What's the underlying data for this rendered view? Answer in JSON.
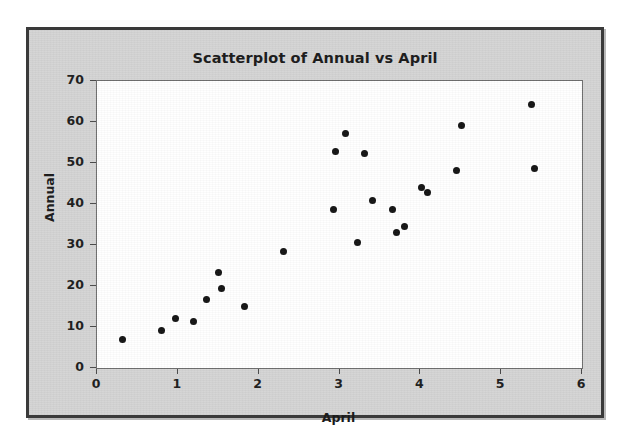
{
  "figure": {
    "title": "Scatterplot of Annual vs April",
    "background_color": "#d4d4d4",
    "plot_background_color": "#ffffff",
    "border_color": "#3a3a3a",
    "point_color": "#141414"
  },
  "axes": {
    "x_title": "April",
    "y_title": "Annual",
    "x_ticks": [
      "0",
      "1",
      "2",
      "3",
      "4",
      "5",
      "6"
    ],
    "y_ticks": [
      "0",
      "10",
      "20",
      "30",
      "40",
      "50",
      "60",
      "70"
    ]
  },
  "chart_data": {
    "type": "scatter",
    "title": "Scatterplot of Annual vs April",
    "xlabel": "April",
    "ylabel": "Annual",
    "xlim": [
      0,
      6
    ],
    "ylim": [
      0,
      70
    ],
    "xticks": [
      0,
      1,
      2,
      3,
      4,
      5,
      6
    ],
    "yticks": [
      0,
      10,
      20,
      30,
      40,
      50,
      60,
      70
    ],
    "grid": false,
    "legend": null,
    "marker": "filled-circle",
    "series": [
      {
        "name": "Annual vs April",
        "points": [
          {
            "x": 0.32,
            "y": 6.9
          },
          {
            "x": 0.8,
            "y": 9.2
          },
          {
            "x": 0.97,
            "y": 12.0
          },
          {
            "x": 1.19,
            "y": 11.4
          },
          {
            "x": 1.35,
            "y": 16.8
          },
          {
            "x": 1.5,
            "y": 23.3
          },
          {
            "x": 1.54,
            "y": 19.4
          },
          {
            "x": 1.82,
            "y": 15.0
          },
          {
            "x": 2.31,
            "y": 28.3
          },
          {
            "x": 2.92,
            "y": 38.6
          },
          {
            "x": 2.95,
            "y": 52.7
          },
          {
            "x": 3.07,
            "y": 57.2
          },
          {
            "x": 3.22,
            "y": 30.6
          },
          {
            "x": 3.31,
            "y": 52.3
          },
          {
            "x": 3.41,
            "y": 40.8
          },
          {
            "x": 3.66,
            "y": 38.6
          },
          {
            "x": 3.7,
            "y": 33.1
          },
          {
            "x": 3.81,
            "y": 34.6
          },
          {
            "x": 4.02,
            "y": 44.0
          },
          {
            "x": 4.09,
            "y": 42.9
          },
          {
            "x": 4.45,
            "y": 48.1
          },
          {
            "x": 4.51,
            "y": 59.1
          },
          {
            "x": 5.38,
            "y": 64.2
          },
          {
            "x": 5.41,
            "y": 48.6
          }
        ]
      }
    ]
  }
}
